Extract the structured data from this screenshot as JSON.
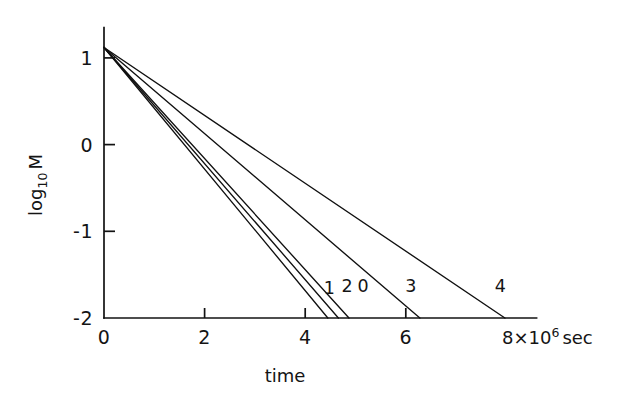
{
  "chart_data": {
    "type": "line",
    "title": "",
    "xlabel": "time",
    "ylabel": "log10 M",
    "x_units": "8×10⁶ sec",
    "x_units_base": "8×10",
    "x_units_exp": "6",
    "x_units_tail": "sec",
    "ylabel_main": "log",
    "ylabel_sub": "10",
    "ylabel_tail": "M",
    "xlim": [
      0,
      8.6
    ],
    "ylim": [
      -2,
      1.35
    ],
    "xticks": [
      0,
      2,
      4,
      6
    ],
    "xticklabels": [
      "0",
      "2",
      "4",
      "6"
    ],
    "yticks": [
      1,
      0,
      -1,
      -2
    ],
    "yticklabels": [
      "1",
      "0",
      "-1",
      "-2"
    ],
    "grid": false,
    "legend": false,
    "common_origin": {
      "x": 0.0,
      "y": 1.12
    },
    "series": [
      {
        "name": "1",
        "label": "1",
        "x": [
          0.0,
          4.45
        ],
        "y": [
          1.12,
          -2.0
        ],
        "label_pos": {
          "x": 4.48,
          "y": -1.72
        }
      },
      {
        "name": "2",
        "label": "2",
        "x": [
          0.0,
          4.66
        ],
        "y": [
          1.12,
          -2.0
        ],
        "label_pos": {
          "x": 4.83,
          "y": -1.7
        }
      },
      {
        "name": "0",
        "label": "0",
        "x": [
          0.0,
          4.87
        ],
        "y": [
          1.12,
          -2.0
        ],
        "label_pos": {
          "x": 5.15,
          "y": -1.7
        }
      },
      {
        "name": "3",
        "label": "3",
        "x": [
          0.0,
          6.28
        ],
        "y": [
          1.12,
          -2.0
        ],
        "label_pos": {
          "x": 6.1,
          "y": -1.7
        }
      },
      {
        "name": "4",
        "label": "4",
        "x": [
          0.0,
          7.97
        ],
        "y": [
          1.12,
          -2.0
        ],
        "label_pos": {
          "x": 7.88,
          "y": -1.7
        }
      }
    ]
  },
  "figure": {
    "background_color": "#ffffff",
    "ink_color": "#121212"
  }
}
